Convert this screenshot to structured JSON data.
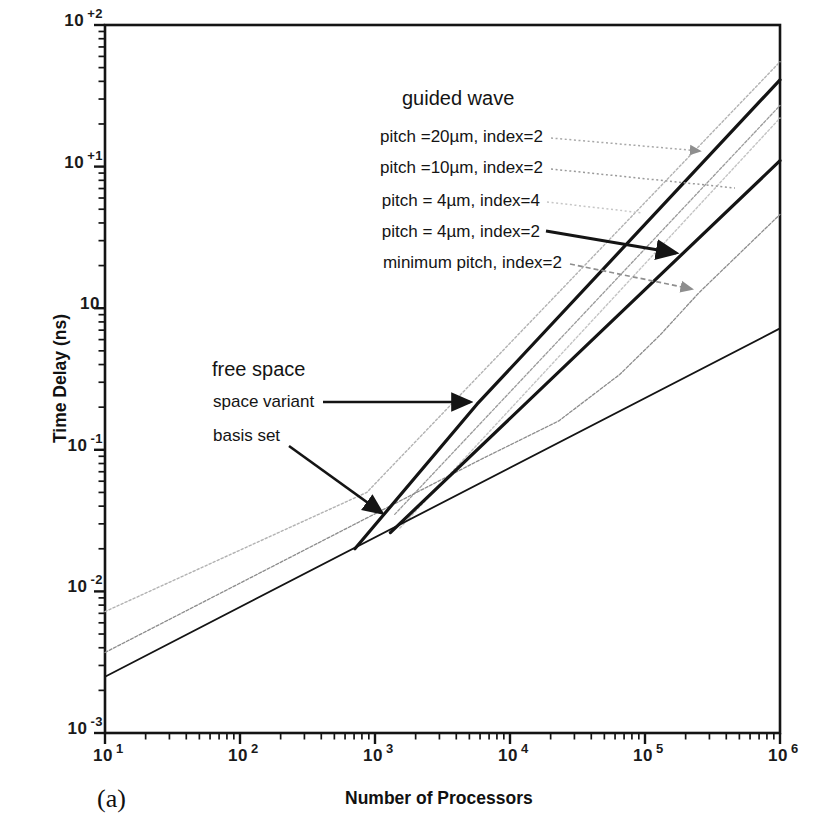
{
  "figure": {
    "panel_label": "(a)"
  },
  "axes": {
    "x": {
      "title": "Number of Processors",
      "scale": "log",
      "tick_labels": [
        {
          "base": "10",
          "exp": "1"
        },
        {
          "base": "10",
          "exp": "2"
        },
        {
          "base": "10",
          "exp": "3"
        },
        {
          "base": "10",
          "exp": "4"
        },
        {
          "base": "10",
          "exp": "5"
        },
        {
          "base": "10",
          "exp": "6"
        }
      ]
    },
    "y": {
      "title": "Time Delay (ns)",
      "scale": "log",
      "tick_labels": [
        {
          "base": "10",
          "exp": "+2"
        },
        {
          "base": "10",
          "exp": "+1"
        },
        {
          "base": "10",
          "exp": ""
        },
        {
          "base": "10",
          "exp": "-1"
        },
        {
          "base": "10",
          "exp": "-2"
        },
        {
          "base": "10",
          "exp": "-3"
        }
      ]
    }
  },
  "chart_data": {
    "type": "line",
    "title": "",
    "xlabel": "Number of Processors",
    "ylabel": "Time Delay (ns)",
    "xscale": "log",
    "yscale": "log",
    "xlim": [
      10,
      1000000
    ],
    "ylim": [
      0.001,
      100
    ],
    "grid": false,
    "legend_position": "annotated-labels",
    "series": [
      {
        "name": "guided wave, pitch=20um, index=2",
        "color": "#b2b2b2",
        "width": 1.4,
        "dash": "2.2,2.2",
        "points": [
          [
            10,
            0.0072
          ],
          [
            870,
            0.05
          ],
          [
            1000000,
            55
          ]
        ]
      },
      {
        "name": "guided wave, pitch=10um, index=2",
        "color": "#9a9a9a",
        "width": 1.3,
        "dash": "2.8,1.8",
        "points": [
          [
            1400,
            0.035
          ],
          [
            1000000,
            27
          ]
        ]
      },
      {
        "name": "guided wave, pitch=4um, index=4",
        "color": "#c4c4c4",
        "width": 1.4,
        "dash": "2.2,2.2",
        "points": [
          [
            1530,
            0.028
          ],
          [
            1000000,
            22
          ]
        ]
      },
      {
        "name": "guided wave, minimum pitch, index=2",
        "color": "#8c8c8c",
        "width": 1.3,
        "dash": "3,1.8",
        "points": [
          [
            10,
            0.0037
          ],
          [
            6000,
            0.085
          ],
          [
            23000,
            0.16
          ],
          [
            65000,
            0.34
          ],
          [
            130000,
            0.65
          ],
          [
            250000,
            1.28
          ],
          [
            1000000,
            4.6
          ]
        ]
      },
      {
        "name": "free space, basis set",
        "color": "#141414",
        "width": 1.8,
        "dash": "",
        "points": [
          [
            10,
            0.0025
          ],
          [
            1000000,
            0.72
          ]
        ]
      },
      {
        "name": "guided wave, pitch=4um, index=2",
        "color": "#141414",
        "width": 3.2,
        "dash": "",
        "points": [
          [
            1300,
            0.026
          ],
          [
            1000000,
            11
          ]
        ]
      },
      {
        "name": "free space, space variant",
        "color": "#141414",
        "width": 3.2,
        "dash": "",
        "points": [
          [
            710,
            0.02
          ],
          [
            5700,
            0.21
          ],
          [
            1000000,
            41
          ]
        ]
      }
    ]
  },
  "annotations": {
    "guided_wave_title": "guided wave",
    "free_space_title": "free space",
    "labels": [
      {
        "id": "pitch-20um",
        "text": "pitch =20µm, index=2",
        "x": 543,
        "y": 127,
        "align": "right",
        "leader": {
          "x1": 551,
          "y1": 138,
          "x2": 700,
          "y2": 151,
          "color": "#a8a8a8",
          "dash": "2,2.6",
          "w": 1.5,
          "head": "gray"
        }
      },
      {
        "id": "pitch-10um",
        "text": "pitch =10µm, index=2",
        "x": 543,
        "y": 158,
        "align": "right",
        "leader": {
          "x1": 551,
          "y1": 169,
          "x2": 735,
          "y2": 188,
          "color": "#9a9a9a",
          "dash": "2,2.6",
          "w": 1.5,
          "head": ""
        }
      },
      {
        "id": "pitch-4um-index4",
        "text": "pitch = 4µm, index=4",
        "x": 540,
        "y": 191,
        "align": "right",
        "leader": {
          "x1": 547,
          "y1": 202,
          "x2": 643,
          "y2": 213,
          "color": "#c6c6c6",
          "dash": "2,2.6",
          "w": 1.5,
          "head": ""
        }
      },
      {
        "id": "pitch-4um-index2",
        "text": "pitch = 4µm, index=2",
        "x": 540,
        "y": 222,
        "align": "right",
        "leader": {
          "x1": 546,
          "y1": 231,
          "x2": 676,
          "y2": 253,
          "color": "#141414",
          "dash": "",
          "w": 2.8,
          "head": "black"
        }
      },
      {
        "id": "minimum-pitch",
        "text": "minimum pitch, index=2",
        "x": 562,
        "y": 253,
        "align": "right",
        "leader": {
          "x1": 570,
          "y1": 264,
          "x2": 692,
          "y2": 289,
          "color": "#8e8e8e",
          "dash": "5,3",
          "w": 1.7,
          "head": "gray"
        }
      },
      {
        "id": "space-variant",
        "text": "space variant",
        "x": 213,
        "y": 392,
        "align": "left",
        "leader": {
          "x1": 323,
          "y1": 402,
          "x2": 470,
          "y2": 402,
          "color": "#141414",
          "dash": "",
          "w": 2.6,
          "head": "black"
        }
      },
      {
        "id": "basis-set",
        "text": "basis set",
        "x": 213,
        "y": 426,
        "align": "left",
        "leader": {
          "x1": 289,
          "y1": 446,
          "x2": 382,
          "y2": 513,
          "color": "#141414",
          "dash": "",
          "w": 2.6,
          "head": "black"
        }
      }
    ]
  }
}
